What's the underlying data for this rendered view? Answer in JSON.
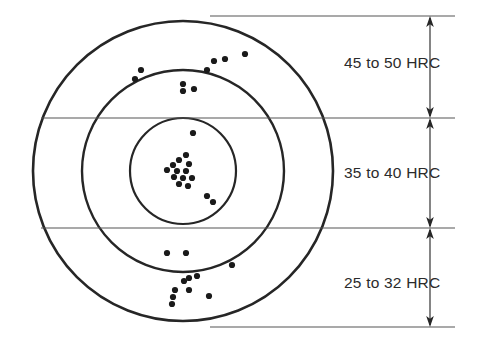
{
  "figure": {
    "background_color": "#ffffff",
    "line_color": "#262626",
    "thin_line_color": "#555555",
    "dot_color": "#1a1a1a",
    "text_color": "#2b2b2b"
  },
  "zones": [
    {
      "id": "outer-ring",
      "label": "45 to 50 HRC",
      "label_x": 344,
      "label_y": 68,
      "band_top": 16,
      "band_bottom": 118
    },
    {
      "id": "middle-ring",
      "label": "35 to 40 HRC",
      "label_x": 344,
      "label_y": 178,
      "band_top": 118,
      "band_bottom": 228
    },
    {
      "id": "inner-ring",
      "label": "25 to 32 HRC",
      "label_x": 344,
      "label_y": 288,
      "band_top": 228,
      "band_bottom": 327
    }
  ],
  "chart_data": {
    "type": "scatter",
    "subtitle": "",
    "xlabel": "",
    "ylabel": "",
    "grid": false,
    "legend_position": "right",
    "axis_ranges": {
      "x": [
        0,
        482
      ],
      "y": [
        0,
        353
      ]
    },
    "target": {
      "center_x": 183,
      "center_y": 171,
      "circles": [
        {
          "name": "outer-circle",
          "radius": 150,
          "stroke_width": 2.6
        },
        {
          "name": "middle-circle",
          "radius": 101,
          "stroke_width": 2.4
        },
        {
          "name": "inner-circle",
          "radius": 53,
          "stroke_width": 2.2
        }
      ]
    },
    "dimension_lines": {
      "x": 430,
      "extension_x_start": 210,
      "extension_x_end": 455,
      "ticks_y": [
        16,
        118,
        228,
        327
      ]
    },
    "series": [
      {
        "name": "45 to 50 HRC scatter",
        "zone": "outer-ring",
        "count": 9,
        "points": [
          [
            141,
            70
          ],
          [
            135,
            79
          ],
          [
            214,
            61
          ],
          [
            225,
            59
          ],
          [
            245,
            54
          ],
          [
            207,
            70
          ],
          [
            183,
            84
          ],
          [
            183,
            91
          ],
          [
            194,
            89
          ]
        ]
      },
      {
        "name": "35 to 40 HRC scatter",
        "zone": "middle-ring",
        "count": 15,
        "points": [
          [
            193,
            133
          ],
          [
            186,
            155
          ],
          [
            179,
            160
          ],
          [
            173,
            165
          ],
          [
            189,
            164
          ],
          [
            167,
            170
          ],
          [
            177,
            171
          ],
          [
            186,
            171
          ],
          [
            174,
            177
          ],
          [
            183,
            178
          ],
          [
            192,
            178
          ],
          [
            179,
            184
          ],
          [
            188,
            186
          ],
          [
            207,
            196
          ],
          [
            213,
            202
          ]
        ]
      },
      {
        "name": "25 to 32 HRC scatter",
        "zone": "inner-ring",
        "count": 11,
        "points": [
          [
            167,
            253
          ],
          [
            186,
            253
          ],
          [
            232,
            265
          ],
          [
            189,
            278
          ],
          [
            184,
            281
          ],
          [
            197,
            276
          ],
          [
            189,
            290
          ],
          [
            175,
            290
          ],
          [
            173,
            297
          ],
          [
            209,
            296
          ],
          [
            172,
            304
          ]
        ]
      }
    ]
  }
}
